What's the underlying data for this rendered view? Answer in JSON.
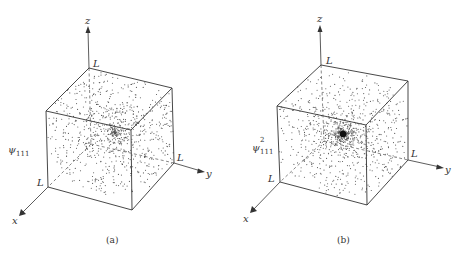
{
  "figure": {
    "panels": [
      {
        "id": "a",
        "caption": "(a)",
        "function_label": {
          "symbol": "ψ",
          "subscript": "111",
          "superscript": ""
        },
        "axis_labels": {
          "x": "x",
          "y": "y",
          "z": "z"
        },
        "corner_labels": {
          "x": "L",
          "y": "L",
          "z": "L"
        },
        "peak_style": "diffuse"
      },
      {
        "id": "b",
        "caption": "(b)",
        "function_label": {
          "symbol": "ψ",
          "subscript": "111",
          "superscript": "2"
        },
        "axis_labels": {
          "x": "x",
          "y": "y",
          "z": "z"
        },
        "corner_labels": {
          "x": "L",
          "y": "L",
          "z": "L"
        },
        "peak_style": "concentrated"
      }
    ]
  }
}
